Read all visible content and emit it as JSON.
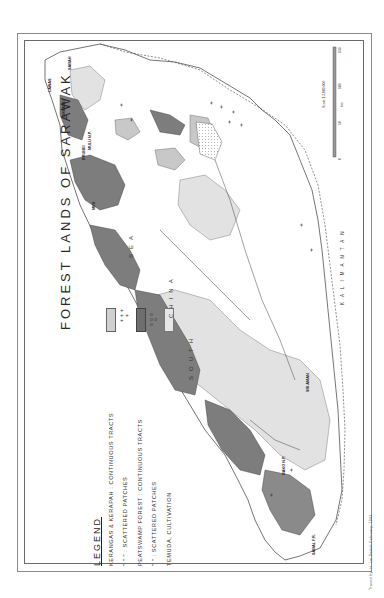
{
  "map": {
    "title": "FOREST LANDS OF SARAWAK",
    "legend": {
      "heading": "LEGEND",
      "rows": [
        {
          "category": "KERANGAS & KERAPAH",
          "sep": ":",
          "type": "CONTINUOUS TRACTS",
          "symbol": "light-stipple-fill"
        },
        {
          "category": "\"     \"     \"",
          "sep": ":",
          "type": "SCATTERED PATCHES",
          "symbol": "plus-signs"
        },
        {
          "category": "PEATSWAMP  FOREST",
          "sep": ":",
          "type": "CONTINUOUS TRACTS",
          "symbol": "dark-grey-fill"
        },
        {
          "category": "\"     \"",
          "sep": ":",
          "type": "SCATTERED PATCHES",
          "symbol": "small-circles"
        },
        {
          "category": "TEMUDA, CULTIVATION",
          "sep": "",
          "type": "",
          "symbol": "pale-grey-fill"
        }
      ]
    },
    "sea_labels": [
      "SOUTH",
      "CHINA",
      "SEA"
    ],
    "region_labels": {
      "kalimantan": "KALIMANTAN",
      "sabah": "SABAH",
      "brunei": "BRUNEI",
      "mulu": "MULU N.P.",
      "bako": "BAKO N.P.",
      "sabal": "SABAL F.R.",
      "miri": "MIRI",
      "limbang": "LIMBANG",
      "lawas": "LAWAS",
      "sri_aman": "SRI AMAN"
    },
    "scale": {
      "text": "Scale 1:2,000,000",
      "ticks": [
        "0",
        "50",
        "100",
        "150"
      ],
      "unit": "km"
    },
    "credit": "Traced by: H. Lai    Dated: February, 1993",
    "colors": {
      "peatswamp": "#7d7d7d",
      "kerangas": "#c8c8c8",
      "temuda": "#e2e2e2",
      "outline": "#3a3a3a"
    }
  }
}
